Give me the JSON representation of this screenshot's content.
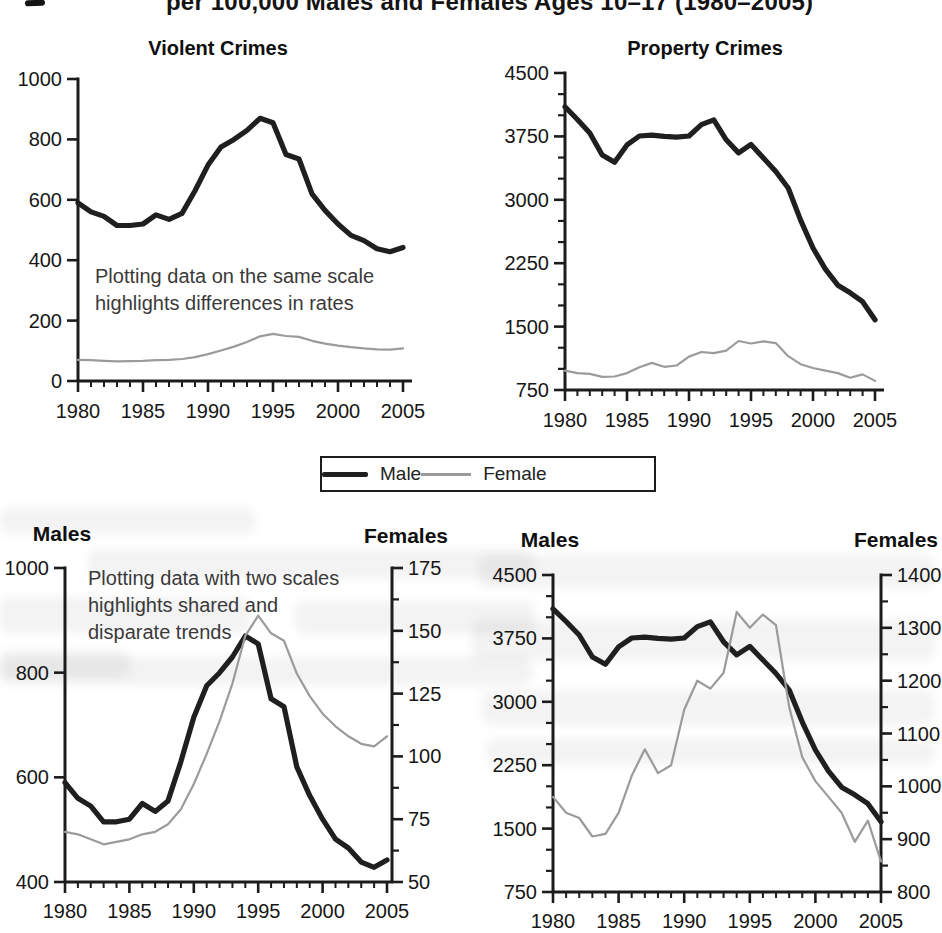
{
  "page": {
    "clipped_title": "per 100,000 Males and Females Ages 10–17 (1980–2005)"
  },
  "colors": {
    "male_line": "#1f1f1f",
    "female_line": "#9b9b9b",
    "axis": "#1c1c1c",
    "tick_label": "#161616",
    "annotation": "#3a3a3a",
    "title_text": "#0f0f0f"
  },
  "legend": {
    "male_label": "Male",
    "female_label": "Female"
  },
  "chart_data": {
    "type": "line",
    "years": [
      1980,
      1981,
      1982,
      1983,
      1984,
      1985,
      1986,
      1987,
      1988,
      1989,
      1990,
      1991,
      1992,
      1993,
      1994,
      1995,
      1996,
      1997,
      1998,
      1999,
      2000,
      2001,
      2002,
      2003,
      2004,
      2005
    ],
    "x_ticks": [
      1980,
      1985,
      1990,
      1995,
      2000,
      2005
    ],
    "charts": [
      {
        "id": "violent-crimes-same-scale",
        "title": "Violent Crimes",
        "annotation": [
          "Plotting data on the same scale",
          "highlights differences in rates"
        ],
        "left_axis": {
          "label": null,
          "lim": [
            0,
            1000
          ],
          "ticks": [
            0,
            200,
            400,
            600,
            800,
            1000
          ],
          "minors_between": 0
        },
        "right_axis": null,
        "series": [
          {
            "name": "Male",
            "axis": "left",
            "color_key": "male_line",
            "values": [
              590,
              560,
              545,
              515,
              515,
              520,
              550,
              535,
              555,
              630,
              715,
              775,
              800,
              830,
              870,
              855,
              750,
              735,
              620,
              565,
              520,
              482,
              465,
              438,
              428,
              442
            ]
          },
          {
            "name": "Female",
            "axis": "left",
            "color_key": "female_line",
            "values": [
              70,
              69,
              67,
              65,
              66,
              67,
              69,
              70,
              73,
              79,
              89,
              101,
              114,
              129,
              148,
              156,
              149,
              146,
              133,
              124,
              117,
              112,
              108,
              105,
              104,
              108
            ]
          }
        ]
      },
      {
        "id": "property-crimes-same-scale",
        "title": "Property Crimes",
        "annotation": null,
        "left_axis": {
          "label": null,
          "lim": [
            750,
            4500
          ],
          "ticks": [
            750,
            1500,
            2250,
            3000,
            3750,
            4500
          ],
          "minors_between": 2
        },
        "right_axis": null,
        "series": [
          {
            "name": "Male",
            "axis": "left",
            "color_key": "male_line",
            "values": [
              4100,
              3950,
              3790,
              3530,
              3445,
              3650,
              3755,
              3765,
              3750,
              3740,
              3755,
              3890,
              3945,
              3710,
              3555,
              3655,
              3495,
              3335,
              3140,
              2760,
              2430,
              2180,
              1990,
              1900,
              1795,
              1580
            ]
          },
          {
            "name": "Female",
            "axis": "left",
            "color_key": "female_line",
            "values": [
              980,
              950,
              940,
              905,
              910,
              950,
              1020,
              1070,
              1025,
              1040,
              1145,
              1200,
              1185,
              1215,
              1330,
              1300,
              1325,
              1305,
              1150,
              1055,
              1010,
              980,
              950,
              895,
              935,
              858
            ]
          }
        ]
      },
      {
        "id": "violent-crimes-two-scales",
        "title": null,
        "annotation": [
          "Plotting data with two scales",
          "highlights shared and",
          "disparate trends"
        ],
        "left_axis": {
          "label": "Males",
          "lim": [
            400,
            1000
          ],
          "ticks": [
            400,
            600,
            800,
            1000
          ],
          "minors_between": 0
        },
        "right_axis": {
          "label": "Females",
          "lim": [
            50,
            175
          ],
          "ticks": [
            50,
            75,
            100,
            125,
            150,
            175
          ],
          "minors_between": 1
        },
        "series": [
          {
            "name": "Male",
            "axis": "left",
            "color_key": "male_line",
            "values": [
              590,
              560,
              545,
              515,
              515,
              520,
              550,
              535,
              555,
              630,
              715,
              775,
              800,
              830,
              870,
              855,
              750,
              735,
              620,
              565,
              520,
              482,
              465,
              438,
              428,
              442
            ]
          },
          {
            "name": "Female",
            "axis": "right",
            "color_key": "female_line",
            "values": [
              70,
              69,
              67,
              65,
              66,
              67,
              69,
              70,
              73,
              79,
              89,
              101,
              114,
              129,
              148,
              156,
              149,
              146,
              133,
              124,
              117,
              112,
              108,
              105,
              104,
              108
            ]
          }
        ]
      },
      {
        "id": "property-crimes-two-scales",
        "title": null,
        "annotation": null,
        "left_axis": {
          "label": "Males",
          "lim": [
            750,
            4500
          ],
          "ticks": [
            750,
            1500,
            2250,
            3000,
            3750,
            4500
          ],
          "minors_between": 2
        },
        "right_axis": {
          "label": "Females",
          "lim": [
            800,
            1400
          ],
          "ticks": [
            800,
            900,
            1000,
            1100,
            1200,
            1300,
            1400
          ],
          "minors_between": 1
        },
        "series": [
          {
            "name": "Male",
            "axis": "left",
            "color_key": "male_line",
            "values": [
              4100,
              3950,
              3790,
              3530,
              3445,
              3650,
              3755,
              3765,
              3750,
              3740,
              3755,
              3890,
              3945,
              3710,
              3555,
              3655,
              3495,
              3335,
              3140,
              2760,
              2430,
              2180,
              1990,
              1900,
              1795,
              1580
            ]
          },
          {
            "name": "Female",
            "axis": "right",
            "color_key": "female_line",
            "values": [
              980,
              950,
              940,
              905,
              910,
              950,
              1020,
              1070,
              1025,
              1040,
              1145,
              1200,
              1185,
              1215,
              1330,
              1300,
              1325,
              1305,
              1150,
              1055,
              1010,
              980,
              950,
              895,
              935,
              858
            ]
          }
        ]
      }
    ]
  }
}
